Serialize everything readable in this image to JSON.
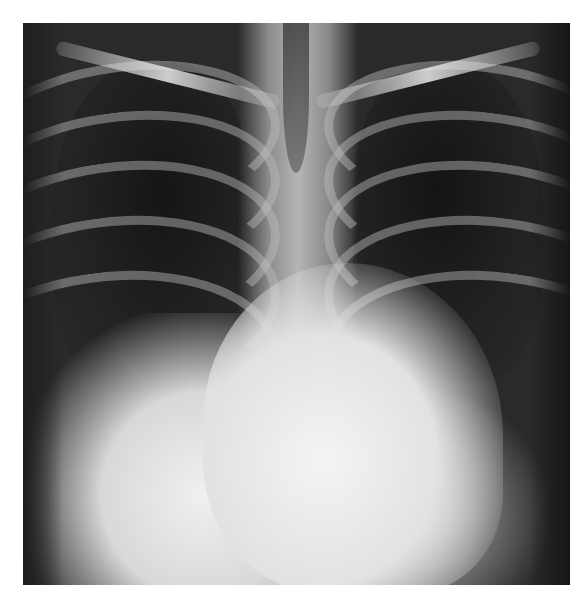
{
  "image": {
    "subject": "chest-xray-pa-view",
    "description": "Frontal chest radiograph with enlarged cardiac silhouette and right lower zone opacity",
    "colors": {
      "background": "#ffffff",
      "lung_dark": "#151515",
      "bone_light": "#d0d0d0",
      "heart_bright": "#f4f4f4"
    }
  }
}
